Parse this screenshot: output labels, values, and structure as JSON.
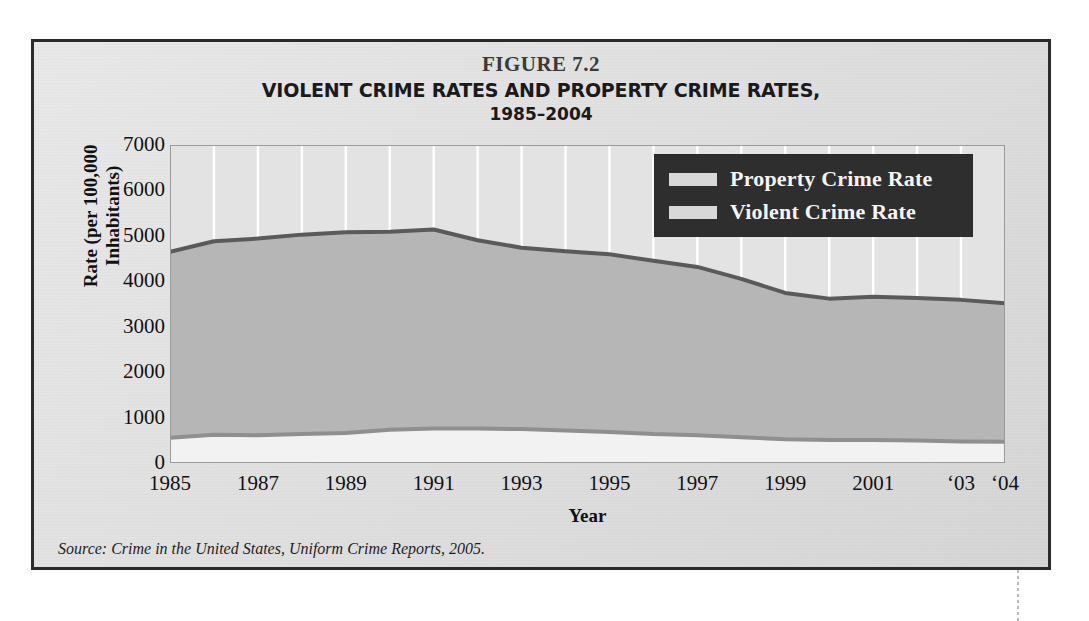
{
  "figure": {
    "number": "FIGURE 7.2",
    "title": "VIOLENT CRIME RATES AND PROPERTY CRIME RATES,",
    "subtitle": "1985–2004",
    "source_note": "Source: Crime in the United States, Uniform Crime Reports, 2005."
  },
  "colors": {
    "frame_border": "#2b2b2b",
    "page_background": "#dcdcdc",
    "plot_background": "#e3e3e3",
    "gridline": "#ffffff",
    "property_area_fill": "#b6b6b6",
    "property_line": "#5a5a5a",
    "violent_area_fill": "#f2f2f2",
    "violent_line": "#8f8f8f",
    "legend_background": "#2e2e2e",
    "legend_text": "#f5f5f5",
    "legend_swatch": "#d8d8d8",
    "axis_text": "#111111"
  },
  "axes": {
    "y_title_line1": "Rate (per 100,000",
    "y_title_line2": "Inhabitants)",
    "x_title": "Year",
    "y_ticks": [
      "7000",
      "6000",
      "5000",
      "4000",
      "3000",
      "2000",
      "1000",
      "0"
    ],
    "x_ticks": [
      {
        "label": "1985",
        "year": 1985
      },
      {
        "label": "1987",
        "year": 1987
      },
      {
        "label": "1989",
        "year": 1989
      },
      {
        "label": "1991",
        "year": 1991
      },
      {
        "label": "1993",
        "year": 1993
      },
      {
        "label": "1995",
        "year": 1995
      },
      {
        "label": "1997",
        "year": 1997
      },
      {
        "label": "1999",
        "year": 1999
      },
      {
        "label": "2001",
        "year": 2001
      },
      {
        "label": "‘03",
        "year": 2003
      },
      {
        "label": "‘04",
        "year": 2004
      }
    ]
  },
  "legend": {
    "position": "top-right-inside-plot",
    "items": [
      {
        "label": "Property Crime Rate",
        "swatch": "#d8d8d8"
      },
      {
        "label": "Violent Crime Rate",
        "swatch": "#d8d8d8"
      }
    ]
  },
  "chart_data": {
    "type": "area",
    "title": "VIOLENT CRIME RATES AND PROPERTY CRIME RATES, 1985–2004",
    "xlabel": "Year",
    "ylabel": "Rate (per 100,000 Inhabitants)",
    "xlim": [
      1985,
      2004
    ],
    "ylim": [
      0,
      7000
    ],
    "ytick_step": 1000,
    "grid": "vertical-white-gridlines-each-year",
    "legend_position": "upper right",
    "x": [
      1985,
      1986,
      1987,
      1988,
      1989,
      1990,
      1991,
      1992,
      1993,
      1994,
      1995,
      1996,
      1997,
      1998,
      1999,
      2000,
      2001,
      2002,
      2003,
      2004
    ],
    "series": [
      {
        "name": "Property Crime Rate",
        "color": "#b6b6b6",
        "line_color": "#5a5a5a",
        "values": [
          4650,
          4880,
          4940,
          5027,
          5078,
          5089,
          5140,
          4903,
          4740,
          4660,
          4593,
          4451,
          4316,
          4053,
          3744,
          3618,
          3658,
          3631,
          3591,
          3517
        ]
      },
      {
        "name": "Violent Crime Rate",
        "color": "#f2f2f2",
        "line_color": "#8f8f8f",
        "values": [
          557,
          620,
          610,
          640,
          663,
          730,
          758,
          758,
          747,
          714,
          685,
          637,
          611,
          568,
          523,
          507,
          505,
          495,
          475,
          466
        ]
      }
    ]
  }
}
